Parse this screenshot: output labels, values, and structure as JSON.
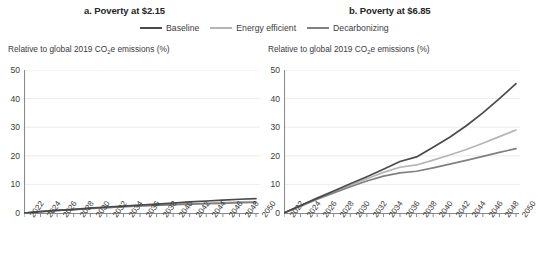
{
  "legend": {
    "items": [
      {
        "label": "Baseline",
        "color": "#4a4a4a"
      },
      {
        "label": "Energy efficient",
        "color": "#b5b5b5"
      },
      {
        "label": "Decarbonizing",
        "color": "#808080"
      }
    ]
  },
  "panels": {
    "a": {
      "title": "a. Poverty at $2.15",
      "axis_note": "Relative to global 2019 CO2e emissions (%)"
    },
    "b": {
      "title": "b. Poverty at $6.85",
      "axis_note": "Relative to global 2019 CO2e emissions (%)"
    }
  },
  "chart_data": [
    {
      "type": "line",
      "title": "a. Poverty at $2.15",
      "xlabel": "",
      "ylabel": "Relative to global 2019 CO2e emissions (%)",
      "ylim": [
        0,
        50
      ],
      "yticks": [
        0,
        10,
        20,
        30,
        40,
        50
      ],
      "grid": true,
      "legend_position": "top-center-shared",
      "x": [
        2022,
        2024,
        2026,
        2028,
        2030,
        2032,
        2034,
        2036,
        2038,
        2040,
        2042,
        2044,
        2046,
        2048,
        2050
      ],
      "xticklabels": [
        "2022",
        "2024",
        "2026",
        "2028",
        "2030",
        "2032",
        "2034",
        "2036",
        "2038",
        "2040",
        "2042",
        "2044",
        "2046",
        "2048",
        "2050"
      ],
      "series": [
        {
          "name": "Baseline",
          "color": "#4a4a4a",
          "values": [
            0,
            0.5,
            0.9,
            1.3,
            1.7,
            2.1,
            2.4,
            2.8,
            3.1,
            3.5,
            3.9,
            4.2,
            4.5,
            4.8,
            5.0
          ]
        },
        {
          "name": "Energy efficient",
          "color": "#b5b5b5",
          "values": [
            0,
            0.5,
            0.9,
            1.2,
            1.6,
            1.9,
            2.2,
            2.5,
            2.8,
            3.0,
            3.2,
            3.4,
            3.6,
            3.8,
            3.9
          ]
        },
        {
          "name": "Decarbonizing",
          "color": "#808080",
          "values": [
            0,
            0.5,
            0.9,
            1.2,
            1.6,
            1.9,
            2.2,
            2.5,
            2.7,
            2.9,
            3.1,
            3.3,
            3.4,
            3.6,
            3.7
          ]
        }
      ]
    },
    {
      "type": "line",
      "title": "b. Poverty at $6.85",
      "xlabel": "",
      "ylabel": "Relative to global 2019 CO2e emissions (%)",
      "ylim": [
        0,
        50
      ],
      "yticks": [
        0,
        10,
        20,
        30,
        40,
        50
      ],
      "grid": true,
      "legend_position": "top-center-shared",
      "x": [
        2022,
        2024,
        2026,
        2028,
        2030,
        2032,
        2034,
        2036,
        2038,
        2040,
        2042,
        2044,
        2046,
        2048,
        2050
      ],
      "xticklabels": [
        "2022",
        "2024",
        "2026",
        "2028",
        "2030",
        "2032",
        "2034",
        "2036",
        "2038",
        "2040",
        "2042",
        "2044",
        "2046",
        "2048",
        "2050"
      ],
      "series": [
        {
          "name": "Baseline",
          "color": "#4a4a4a",
          "values": [
            0,
            2.6,
            5.2,
            7.7,
            10.2,
            12.7,
            15.3,
            18.0,
            19.6,
            23.0,
            26.5,
            30.5,
            35.0,
            40.0,
            45.2
          ]
        },
        {
          "name": "Energy efficient",
          "color": "#b5b5b5",
          "values": [
            0,
            2.5,
            5.0,
            7.4,
            9.7,
            12.0,
            14.2,
            16.0,
            16.8,
            18.5,
            20.3,
            22.2,
            24.4,
            26.7,
            29.0
          ]
        },
        {
          "name": "Decarbonizing",
          "color": "#808080",
          "values": [
            0,
            2.4,
            4.8,
            7.0,
            9.2,
            11.2,
            12.9,
            14.0,
            14.6,
            15.8,
            17.1,
            18.4,
            19.8,
            21.2,
            22.5
          ]
        }
      ]
    }
  ]
}
